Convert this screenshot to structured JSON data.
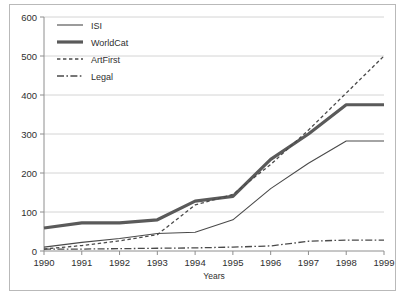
{
  "chart_data": {
    "type": "line",
    "title": "",
    "xlabel": "Years",
    "ylabel": "",
    "x": [
      "1990",
      "1991",
      "1992",
      "1993",
      "1994",
      "1995",
      "1996",
      "1997",
      "1998",
      "1999"
    ],
    "xlim": [
      1990,
      1999
    ],
    "ylim": [
      0,
      600
    ],
    "yticks": [
      0,
      100,
      200,
      300,
      400,
      500,
      600
    ],
    "grid": true,
    "legend_position": "top-left",
    "series": [
      {
        "name": "ISI",
        "style": "solid-thin",
        "values": [
          10,
          22,
          32,
          45,
          48,
          80,
          160,
          225,
          282,
          282
        ]
      },
      {
        "name": "WorldCat",
        "style": "solid-thick",
        "values": [
          59,
          72,
          72,
          80,
          128,
          140,
          235,
          300,
          375,
          375
        ]
      },
      {
        "name": "ArtFirst",
        "style": "dashed",
        "values": [
          5,
          14,
          26,
          42,
          118,
          145,
          222,
          310,
          405,
          500
        ]
      },
      {
        "name": "Legal",
        "style": "dash-dot",
        "values": [
          5,
          5,
          6,
          7,
          8,
          10,
          13,
          25,
          28,
          28
        ]
      }
    ]
  },
  "legend": {
    "items": [
      {
        "label": "ISI"
      },
      {
        "label": "WorldCat"
      },
      {
        "label": "ArtFirst"
      },
      {
        "label": "Legal"
      }
    ]
  },
  "axes": {
    "y_ticks": [
      "600",
      "500",
      "400",
      "300",
      "200",
      "100",
      "0"
    ],
    "x_ticks": [
      "1990",
      "1991",
      "1992",
      "1993",
      "1994",
      "1995",
      "1996",
      "1997",
      "1998",
      "1999"
    ],
    "x_title": "Years"
  }
}
